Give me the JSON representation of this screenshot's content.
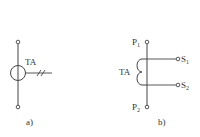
{
  "diagram": {
    "colors": {
      "line": "#444444",
      "text": "#333333",
      "background": "#ffffff"
    },
    "figure_a": {
      "caption": "a)",
      "device_label": "TA",
      "symbol": "circle-on-line-with-double-slash-secondary"
    },
    "figure_b": {
      "caption": "b)",
      "device_label": "TA",
      "terminals": {
        "primary_top": {
          "base": "P",
          "sub": "1"
        },
        "primary_bottom": {
          "base": "P",
          "sub": "2"
        },
        "secondary_top": {
          "base": "S",
          "sub": "1"
        },
        "secondary_bottom": {
          "base": "S",
          "sub": "2"
        }
      },
      "symbol": "coil-two-loops"
    }
  }
}
